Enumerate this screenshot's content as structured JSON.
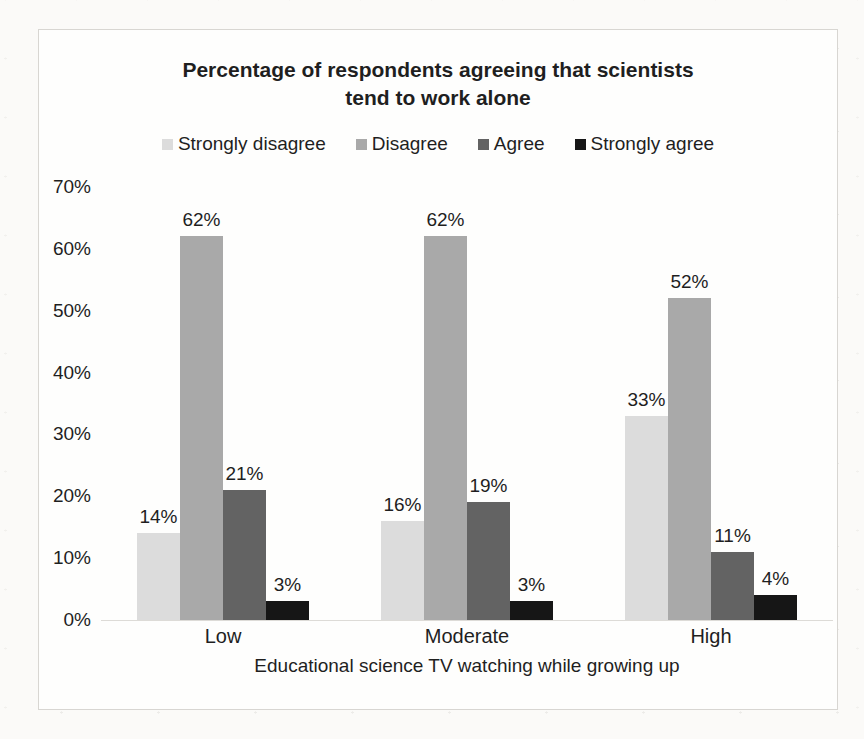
{
  "page": {
    "background": "#fbfaf8"
  },
  "chart_data": {
    "type": "bar",
    "title": "Percentage of respondents agreeing that scientists\ntend to work alone",
    "xlabel": "Educational science TV watching while growing up",
    "ylabel": "",
    "categories": [
      "Low",
      "Moderate",
      "High"
    ],
    "series": [
      {
        "name": "Strongly disagree",
        "color": "#dcdcdc",
        "values": [
          14,
          16,
          33
        ]
      },
      {
        "name": "Disagree",
        "color": "#a9a9a9",
        "values": [
          62,
          62,
          52
        ]
      },
      {
        "name": "Agree",
        "color": "#636363",
        "values": [
          21,
          19,
          11
        ]
      },
      {
        "name": "Strongly agree",
        "color": "#161616",
        "values": [
          3,
          3,
          4
        ]
      }
    ],
    "data_label_suffix": "%",
    "y_axis": {
      "min": 0,
      "max": 70,
      "step": 10,
      "tick_suffix": "%"
    },
    "legend_position": "top",
    "grid": false,
    "data_labels": true,
    "colors": {
      "text": "#1f1f1f",
      "frame_border": "#d8d6d2",
      "axis_line": "#dddbd7",
      "plot_background": "#fefefd"
    }
  }
}
